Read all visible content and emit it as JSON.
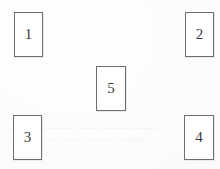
{
  "figure": {
    "type": "diagram",
    "background_color": "#fdfdfd",
    "box_border_color": "#6e6e70",
    "numeral_color": "#3a3a3c",
    "boxes": [
      {
        "id": "box-1",
        "label": "1",
        "position": "top-left"
      },
      {
        "id": "box-2",
        "label": "2",
        "position": "top-right"
      },
      {
        "id": "box-5",
        "label": "5",
        "position": "center"
      },
      {
        "id": "box-3",
        "label": "3",
        "position": "bottom-left"
      },
      {
        "id": "box-4",
        "label": "4",
        "position": "bottom-right"
      }
    ],
    "ghost_text": {
      "line_1": "—— ———",
      "line_2": "——— ——— —— ————— ——",
      "line_3": "———   ———   —— —————"
    }
  }
}
